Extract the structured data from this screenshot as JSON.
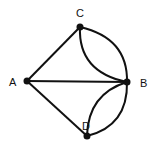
{
  "graph": {
    "nodes": [
      {
        "id": "A",
        "label": "A",
        "x": 27,
        "y": 81,
        "lx": 11,
        "ly": 86
      },
      {
        "id": "B",
        "label": "B",
        "x": 127,
        "y": 82,
        "lx": 140,
        "ly": 87
      },
      {
        "id": "C",
        "label": "C",
        "x": 80,
        "y": 27,
        "lx": 76,
        "ly": 16
      },
      {
        "id": "D",
        "label": "D",
        "x": 87,
        "y": 136,
        "lx": 82,
        "ly": 130
      }
    ],
    "edges": [
      {
        "from": "A",
        "to": "C",
        "type": "straight"
      },
      {
        "from": "A",
        "to": "B",
        "type": "straight"
      },
      {
        "from": "A",
        "to": "D",
        "type": "straight"
      },
      {
        "from": "C",
        "to": "B",
        "type": "outer-arc"
      },
      {
        "from": "C",
        "to": "B",
        "type": "inner-arc"
      },
      {
        "from": "D",
        "to": "B",
        "type": "outer-arc"
      },
      {
        "from": "D",
        "to": "B",
        "type": "inner-arc"
      }
    ],
    "colors": {
      "line": "#111111",
      "node": "#111111",
      "background": "#ffffff"
    }
  }
}
